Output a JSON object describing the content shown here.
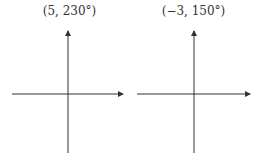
{
  "panels": [
    {
      "label": "(5, 230°)",
      "axes": {
        "origin_x": 68,
        "origin_y": 94,
        "x_start": 12,
        "x_end": 123,
        "y_start": 31,
        "y_end": 153
      }
    },
    {
      "label": "(−3, 150°)",
      "axes": {
        "origin_x": 194,
        "origin_y": 94,
        "x_start": 137,
        "x_end": 250,
        "y_start": 31,
        "y_end": 153
      }
    }
  ],
  "colors": {
    "axis": "#333333",
    "label": "#333333",
    "background": "#ffffff"
  }
}
